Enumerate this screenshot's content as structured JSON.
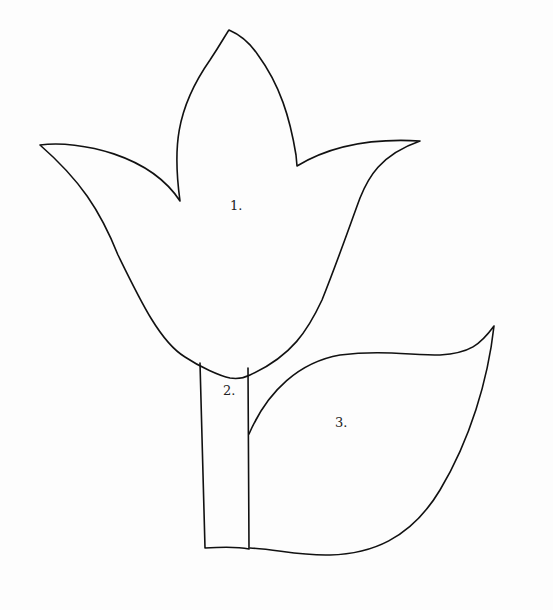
{
  "diagram": {
    "background_color": "#fdfdfd",
    "line_color": "#111111",
    "parts": [
      {
        "id": "flower-head",
        "label": "1.",
        "x": 237,
        "y": 228
      },
      {
        "id": "stem",
        "label": "2.",
        "x": 224,
        "y": 447
      },
      {
        "id": "leaf",
        "label": "3.",
        "x": 338,
        "y": 474
      }
    ]
  }
}
